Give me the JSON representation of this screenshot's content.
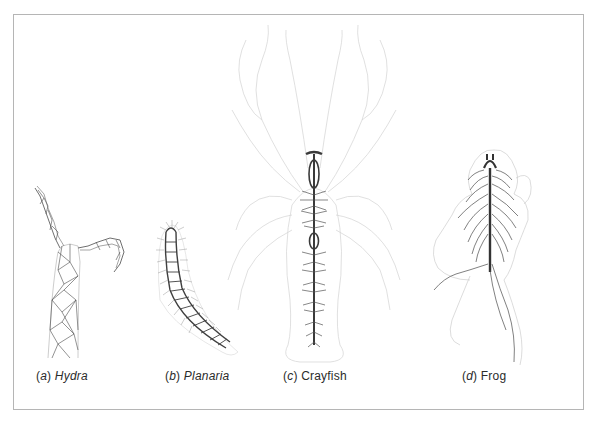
{
  "figure": {
    "border_color": "#b5b5b5",
    "line_color": "#3a3a3a",
    "faint_color": "#cfcfcf",
    "panels": [
      {
        "id": "a",
        "letter": "a",
        "name": "Hydra",
        "name_italic": true,
        "depicts": "nerve net"
      },
      {
        "id": "b",
        "letter": "b",
        "name": "Planaria",
        "name_italic": true,
        "depicts": "ladder-type nervous system"
      },
      {
        "id": "c",
        "letter": "c",
        "name": "Crayfish",
        "name_italic": false,
        "depicts": "ventral nerve cord with ganglia"
      },
      {
        "id": "d",
        "letter": "d",
        "name": "Frog",
        "name_italic": false,
        "depicts": "central nervous system with spinal nerves"
      }
    ]
  },
  "captions": {
    "a": {
      "open": "(",
      "letter": "a",
      "close": ") ",
      "name": "Hydra"
    },
    "b": {
      "open": "(",
      "letter": "b",
      "close": ") ",
      "name": "Planaria"
    },
    "c": {
      "open": "(",
      "letter": "c",
      "close": ") ",
      "name": "Crayfish"
    },
    "d": {
      "open": "(",
      "letter": "d",
      "close": ") ",
      "name": "Frog"
    }
  }
}
